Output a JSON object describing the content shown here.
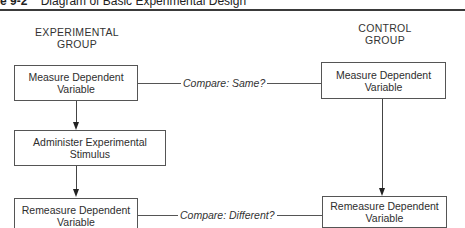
{
  "figure": {
    "number": "e 9-2",
    "title": "Diagram of Basic Experimental Design"
  },
  "experimental_group": {
    "title_line1": "EXPERIMENTAL",
    "title_line2": "GROUP",
    "steps": [
      {
        "line1": "Measure Dependent",
        "line2": "Variable"
      },
      {
        "line1": "Administer Experimental",
        "line2": "Stimulus"
      },
      {
        "line1": "Remeasure Dependent",
        "line2": "Variable"
      }
    ]
  },
  "control_group": {
    "title_line1": "CONTROL",
    "title_line2": "GROUP",
    "steps": [
      {
        "line1": "Measure Dependent",
        "line2": "Variable"
      },
      {
        "line1": "Remeasure Dependent",
        "line2": "Variable"
      }
    ]
  },
  "comparisons": [
    {
      "label": "Compare: Same?"
    },
    {
      "label": "Compare: Different?"
    }
  ]
}
